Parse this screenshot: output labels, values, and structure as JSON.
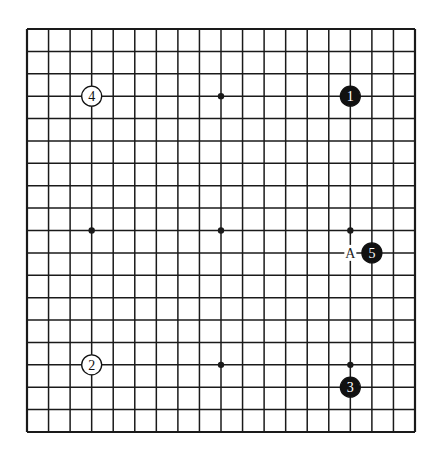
{
  "board": {
    "size": 19,
    "origin": {
      "x": 27,
      "y": 29
    },
    "end": {
      "x": 415,
      "y": 432
    },
    "line_color": "#1a1a1a",
    "background": "#ffffff"
  },
  "star_points": [
    {
      "col": 3,
      "row": 3
    },
    {
      "col": 9,
      "row": 3
    },
    {
      "col": 15,
      "row": 3
    },
    {
      "col": 3,
      "row": 9
    },
    {
      "col": 9,
      "row": 9
    },
    {
      "col": 15,
      "row": 9
    },
    {
      "col": 3,
      "row": 15
    },
    {
      "col": 9,
      "row": 15
    },
    {
      "col": 15,
      "row": 15
    }
  ],
  "stones": [
    {
      "move": "1",
      "color": "black",
      "col": 15,
      "row": 3
    },
    {
      "move": "2",
      "color": "white",
      "col": 3,
      "row": 15
    },
    {
      "move": "3",
      "color": "black",
      "col": 15,
      "row": 16
    },
    {
      "move": "4",
      "color": "white",
      "col": 3,
      "row": 3
    },
    {
      "move": "5",
      "color": "black",
      "col": 16,
      "row": 10
    }
  ],
  "labels": [
    {
      "text": "A",
      "col": 15,
      "row": 10
    }
  ]
}
